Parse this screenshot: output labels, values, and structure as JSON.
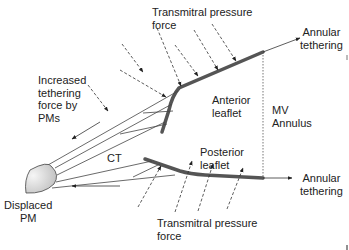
{
  "diagram": {
    "labels": {
      "transmitral_top_line1": "Transmitral pressure",
      "transmitral_top_line2": "force",
      "transmitral_bottom_line1": "Transmitral pressure",
      "transmitral_bottom_line2": "force",
      "annular_top_line1": "Annular",
      "annular_top_line2": "tethering",
      "annular_bottom_line1": "Annular",
      "annular_bottom_line2": "tethering",
      "increased_line1": "Increased",
      "increased_line2": "tethering",
      "increased_line3": "force by",
      "increased_line4": "PMs",
      "anterior_line1": "Anterior",
      "anterior_line2": "leaflet",
      "posterior_line1": "Posterior",
      "posterior_line2": "leaflet",
      "mv_line1": "MV",
      "mv_line2": "Annulus",
      "ct": "CT",
      "pm_line1": "Displaced",
      "pm_line2": "PM"
    },
    "colors": {
      "leaflet": "#555555",
      "line": "#333333",
      "text": "#222222",
      "pm_fill_light": "#f4f4f4",
      "pm_fill_dark": "#bdbdbd"
    }
  }
}
